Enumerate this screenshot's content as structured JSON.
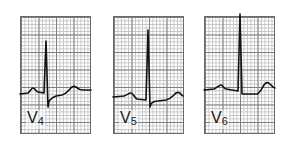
{
  "figure": {
    "leads": [
      {
        "name": "V4",
        "label_main": "V",
        "label_sub": "4"
      },
      {
        "name": "V5",
        "label_main": "V",
        "label_sub": "5"
      },
      {
        "name": "V6",
        "label_main": "V",
        "label_sub": "6"
      }
    ]
  }
}
